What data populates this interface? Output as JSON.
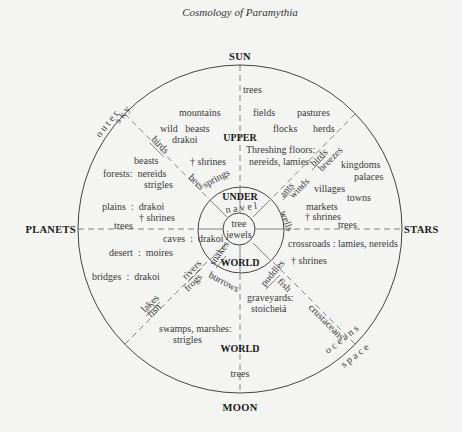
{
  "title": "Cosmology of Paramythia",
  "directions": {
    "north": "SUN",
    "south": "MOON",
    "west": "PLANETS",
    "east": "STARS"
  },
  "realms": {
    "upper": "UPPER",
    "under": "UNDER",
    "world_inner": "WORLD",
    "world_outer": "WORLD"
  },
  "center": {
    "line1": "tree",
    "line2": "jewels"
  },
  "rim_labels": {
    "outer_sky_outer": "o u t e r",
    "outer_sky_inner": "s k y",
    "oceans": "o c e a n s",
    "space": "s p a c e",
    "navel": "n a v e l"
  },
  "spoke_labels": {
    "birds_nw": "birds",
    "bees": "bees",
    "springs": "springs",
    "birds_ne": "birds",
    "breezes": "breezes",
    "ants": "ants",
    "winds": "winds",
    "wells": "wells",
    "rivers": "rivers",
    "frogs": "frogs",
    "snakes": "snakes",
    "burrows": "burrows",
    "lakes": "lakes",
    "fish_sw": "fish",
    "puddles": "puddles",
    "fish_se": "fish",
    "crustaceans": "crustaceans"
  },
  "regions": {
    "top_trees": "trees",
    "mountains": "mountains",
    "wild_beasts": "wild   beasts",
    "drakoi_upper": "drakoi",
    "fields": "fields",
    "pastures": "pastures",
    "flocks": "flocks",
    "herds": "herds",
    "threshing_1": "Threshing floors:",
    "threshing_2": "nereids, lamies",
    "kingdoms": "kingdoms",
    "palaces": "palaces",
    "villages": "villages",
    "towns": "towns",
    "markets": "markets",
    "shrines_east": "† shrines",
    "trees_east": "trees",
    "crossroads": "crossroads : lamies, nereids",
    "shrines_se": "† shrines",
    "graveyards_1": "graveyards:",
    "graveyards_2": "stoicheiá",
    "bottom_trees": "trees",
    "beasts": "beasts",
    "forests_1": "forests:  nereids",
    "forests_2": "strigles",
    "shrines_nw": "† shrines",
    "plains": "plains  :  drakoi",
    "shrines_west": "† shrines",
    "trees_west": "trees",
    "caves": "caves  :  drakoi",
    "desert": "desert  :  moires",
    "bridges": "bridges  :  drakoi",
    "swamps_1": "swamps, marshes:",
    "swamps_2": "strigles"
  }
}
